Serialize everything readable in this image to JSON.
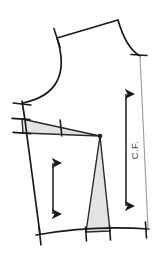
{
  "figure": {
    "name": "bodice-block-pattern-draft",
    "background_color": "#ffffff",
    "ink_color": "#1a1a1a",
    "dart_fill_color": "#e3e3e3",
    "dart_stroke_color": "#2b2b2b",
    "guide_line_color": "#8f8f8f"
  },
  "labels": {
    "center_front": "C.F."
  },
  "annotations": {
    "center_front_line_name": "center-front-guide-line",
    "center_front_arrow_name": "center-front-length-arrow",
    "dart_arrow_name": "dart-length-arrow"
  },
  "geometry": {
    "shoulder_seam": {
      "from": [
        57,
        38
      ],
      "to": [
        118,
        20
      ]
    },
    "neckline_curve": {
      "from": [
        118,
        20
      ],
      "control": [
        124,
        49
      ],
      "to": [
        140,
        56
      ]
    },
    "armhole_curve": {
      "from": [
        57,
        38
      ],
      "control": [
        68,
        88
      ],
      "to": [
        23,
        103
      ]
    },
    "side_seam": {
      "from": [
        23,
        103
      ],
      "to": [
        40,
        234
      ]
    },
    "hem_line": {
      "from": [
        37,
        234
      ],
      "to": [
        148,
        228
      ]
    },
    "center_front_edge": {
      "from": [
        140,
        56
      ],
      "to": [
        148,
        228
      ]
    },
    "bust_apex_point": [
      100,
      136
    ],
    "horizontal_dart": {
      "apex": [
        100,
        136
      ],
      "leg_a": [
        22,
        119
      ],
      "leg_b": [
        23,
        133
      ]
    },
    "vertical_dart": {
      "apex": [
        100,
        136
      ],
      "leg_a": [
        86,
        232
      ],
      "leg_b": [
        110,
        231
      ]
    }
  },
  "notches": [
    {
      "name": "shoulder-notch",
      "x": 57,
      "y": 38,
      "angle": 72
    },
    {
      "name": "neckline-notch",
      "x": 139,
      "y": 55,
      "angle": 4
    },
    {
      "name": "armhole-base-notch",
      "x": 22,
      "y": 104,
      "angle": 6
    },
    {
      "name": "side-waist-upper-notch",
      "x": 20,
      "y": 119,
      "angle": 4
    },
    {
      "name": "side-waist-lower-notch",
      "x": 21,
      "y": 133,
      "angle": 4
    },
    {
      "name": "dart-midpoint-notch",
      "x": 61,
      "y": 128,
      "angle": 84
    },
    {
      "name": "hem-side-notch",
      "x": 40,
      "y": 236,
      "angle": 84
    },
    {
      "name": "hem-dart-left-notch",
      "x": 86,
      "y": 234,
      "angle": 86
    },
    {
      "name": "hem-dart-right-notch",
      "x": 110,
      "y": 233,
      "angle": 86
    },
    {
      "name": "hem-center-front-notch",
      "x": 146,
      "y": 230,
      "angle": 86
    }
  ],
  "arrows": {
    "dart_length": {
      "top": [
        53,
        157
      ],
      "bottom": [
        53,
        220
      ]
    },
    "center_front_length": {
      "top": [
        126,
        88
      ],
      "bottom": [
        126,
        212
      ]
    }
  }
}
